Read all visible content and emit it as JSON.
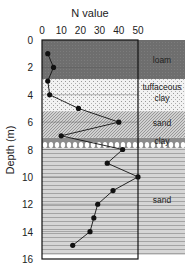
{
  "chart_data": {
    "type": "line",
    "title": "",
    "xlabel": "N value",
    "ylabel": "Depth (m)",
    "xlim": [
      0,
      50
    ],
    "ylim": [
      16,
      0
    ],
    "x_ticks": [
      0,
      10,
      20,
      30,
      40,
      50
    ],
    "y_ticks": [
      0,
      2,
      4,
      6,
      8,
      10,
      12,
      14,
      16
    ],
    "x_axis_position": "top",
    "grid": "horizontal at even depths",
    "series": [
      {
        "name": "N value",
        "marker": "filled-circle",
        "color": "#111111",
        "points": [
          {
            "depth": 1,
            "n": 3
          },
          {
            "depth": 2,
            "n": 6
          },
          {
            "depth": 3,
            "n": 3
          },
          {
            "depth": 4,
            "n": 4
          },
          {
            "depth": 5,
            "n": 19
          },
          {
            "depth": 6,
            "n": 40
          },
          {
            "depth": 7,
            "n": 10
          },
          {
            "depth": 8,
            "n": 42
          },
          {
            "depth": 9,
            "n": 34
          },
          {
            "depth": 10,
            "n": 50
          },
          {
            "depth": 11,
            "n": 37
          },
          {
            "depth": 12,
            "n": 29
          },
          {
            "depth": 13,
            "n": 27
          },
          {
            "depth": 14,
            "n": 25
          },
          {
            "depth": 15,
            "n": 16
          }
        ]
      }
    ],
    "layers": [
      {
        "label": "loam",
        "top": 0,
        "bottom": 2.85,
        "pattern": "dark"
      },
      {
        "label": "tuffaceous clay",
        "top": 2.85,
        "bottom": 5.2,
        "pattern": "dots"
      },
      {
        "label": "sand",
        "top": 5.2,
        "bottom": 7.15,
        "pattern": "hatch"
      },
      {
        "label": "clay",
        "top": 7.15,
        "bottom": 7.9,
        "pattern": "clay"
      },
      {
        "label": "sand",
        "top": 7.9,
        "bottom": 15.7,
        "pattern": "wave"
      }
    ]
  },
  "labels": {
    "x_axis_title": "N value",
    "y_axis_title": "Depth (m)",
    "layer_loam": "loam",
    "layer_tuff_1": "tuffaceous",
    "layer_tuff_2": "clay",
    "layer_sand_1": "sand",
    "layer_clay": "clay",
    "layer_sand_2": "sand"
  }
}
